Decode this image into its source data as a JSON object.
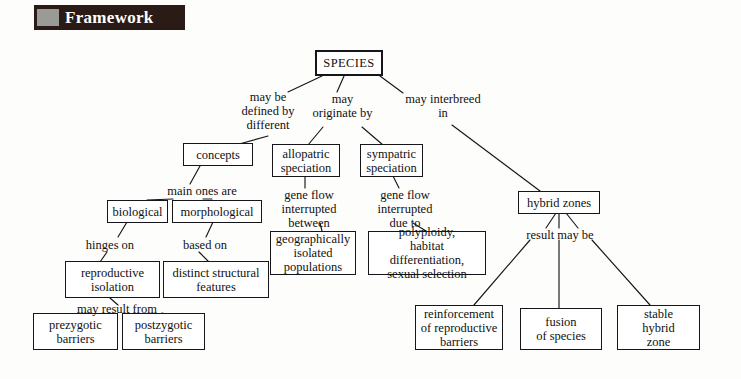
{
  "header": {
    "title": "Framework",
    "swatch_color": "#9a9a96",
    "banner_color": "#2b1b17"
  },
  "diagram": {
    "type": "concept-map",
    "line_color": "#16161a",
    "box_border_color": "#15151a",
    "nodes": [
      {
        "id": "species",
        "label": "SPECIES"
      },
      {
        "id": "concepts",
        "label": "concepts"
      },
      {
        "id": "allopatric",
        "label": "allopatric\nspeciation"
      },
      {
        "id": "sympatric",
        "label": "sympatric\nspeciation"
      },
      {
        "id": "hybrid-zones",
        "label": "hybrid zones"
      },
      {
        "id": "biological",
        "label": "biological"
      },
      {
        "id": "morphological",
        "label": "morphological"
      },
      {
        "id": "geographically",
        "label": "geographically\nisolated\npopulations"
      },
      {
        "id": "polyploidy",
        "label": "polyploidy,\nhabitat differentiation,\nsexual selection"
      },
      {
        "id": "reproductive",
        "label": "reproductive\nisolation"
      },
      {
        "id": "distinct",
        "label": "distinct structural\nfeatures"
      },
      {
        "id": "prezygotic",
        "label": "prezygotic\nbarriers"
      },
      {
        "id": "postzygotic",
        "label": "postzygotic\nbarriers"
      },
      {
        "id": "reinforcement",
        "label": "reinforcement\nof reproductive\nbarriers"
      },
      {
        "id": "fusion",
        "label": "fusion\nof species"
      },
      {
        "id": "stable",
        "label": "stable\nhybrid\nzone"
      }
    ],
    "edge_labels": [
      {
        "id": "may-be-defined-by-different",
        "label": "may be\ndefined by\ndifferent"
      },
      {
        "id": "may-originate-by",
        "label": "may\noriginate by"
      },
      {
        "id": "may-interbreed-in",
        "label": "may interbreed\nin"
      },
      {
        "id": "main-ones-are",
        "label": "main ones are"
      },
      {
        "id": "gene-flow-interrupted-between",
        "label": "gene flow\ninterrupted\nbetween"
      },
      {
        "id": "gene-flow-interrupted-due-to",
        "label": "gene flow\ninterrupted\ndue to"
      },
      {
        "id": "hinges-on",
        "label": "hinges on"
      },
      {
        "id": "based-on",
        "label": "based on"
      },
      {
        "id": "may-result-from",
        "label": "may result from"
      },
      {
        "id": "result-may-be",
        "label": "result may be"
      }
    ]
  }
}
